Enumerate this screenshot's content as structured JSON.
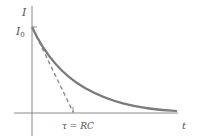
{
  "diagram": {
    "type": "exponential-decay-graph",
    "y_axis_label": "I",
    "initial_value_label": "I",
    "initial_value_subscript": "0",
    "x_axis_label": "t",
    "tau_label": "τ = RC",
    "curve": "I = I0·e^(−t/RC)",
    "tangent": "dashed tangent line from I0 intersecting t-axis at τ"
  },
  "colors": {
    "axis": "#8a8a8a",
    "curve": "#7a7a7a",
    "tangent": "#8a8a8a",
    "text": "#555555",
    "background": "#ffffff"
  }
}
